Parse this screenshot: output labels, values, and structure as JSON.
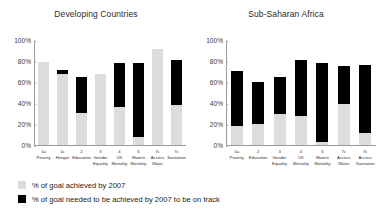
{
  "chart_data": [
    {
      "type": "bar",
      "title": "Developing Countries",
      "xlabel": "",
      "ylabel": "",
      "ylim": [
        0,
        100
      ],
      "ytick_labels": [
        "100%",
        "80%",
        "60%",
        "40%",
        "20%",
        "0%"
      ],
      "ytick_values": [
        100,
        80,
        60,
        40,
        20,
        0
      ],
      "grid": false,
      "stacked": true,
      "legend_position": "bottom-left",
      "categories": [
        "1a\nPoverty",
        "1c\nHunger",
        "2\nEducation",
        "3\nGender\nEquality",
        "4\nU5\nMortality",
        "5\nMatern\nMortality",
        "7c\nAccess\nWater",
        "7c\nSanitation"
      ],
      "series": [
        {
          "name": "% of goal achieved by 2007",
          "color": "#dcdcdc",
          "values": [
            80,
            68,
            31,
            68,
            37,
            8,
            92,
            38
          ]
        },
        {
          "name": "% of goal needed to be achieved by 2007 to be on track",
          "color": "#000000",
          "values": [
            0,
            4,
            34,
            0,
            42,
            71,
            0,
            44
          ]
        }
      ],
      "bar_tops": [
        80,
        72,
        65,
        68,
        79,
        79,
        92,
        82
      ]
    },
    {
      "type": "bar",
      "title": "Sub-Saharan Africa",
      "xlabel": "",
      "ylabel": "",
      "ylim": [
        0,
        100
      ],
      "ytick_labels": [
        "100%",
        "80%",
        "60%",
        "40%",
        "20%",
        "0%"
      ],
      "ytick_values": [
        100,
        80,
        60,
        40,
        20,
        0
      ],
      "grid": false,
      "stacked": true,
      "legend_position": "bottom-left",
      "categories": [
        "1a\nPoverty",
        "2\nEducation",
        "3\nGender\nEquality",
        "4\nU5\nMortality",
        "5\nMatern\nMortality",
        "7c\nAccess\nWater",
        "7c\nAccess\nSanitation"
      ],
      "series": [
        {
          "name": "% of goal achieved by 2007",
          "color": "#dcdcdc",
          "values": [
            18,
            20,
            30,
            28,
            3,
            39,
            12
          ]
        },
        {
          "name": "% of goal needed to be achieved by 2007 to be on track",
          "color": "#000000",
          "values": [
            53,
            41,
            35,
            54,
            76,
            37,
            65
          ]
        }
      ],
      "bar_tops": [
        71,
        61,
        65,
        82,
        79,
        76,
        77
      ]
    }
  ],
  "legend": {
    "items": [
      {
        "label": "% of goal achieved by 2007",
        "color": "#dcdcdc"
      },
      {
        "label": "% of goal needed to be achieved by 2007 to be on track",
        "color": "#000000"
      }
    ]
  }
}
